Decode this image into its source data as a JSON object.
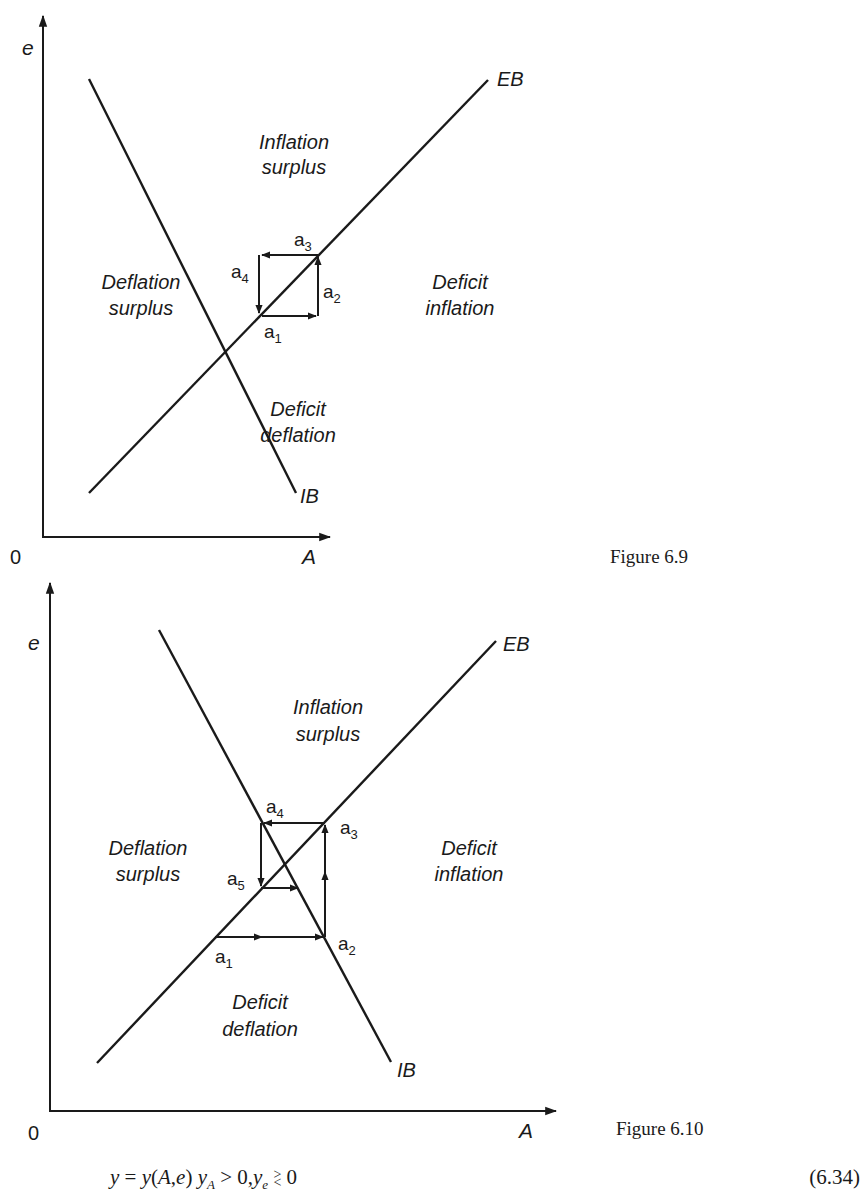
{
  "figure_1": {
    "caption": "Figure 6.9",
    "axis_y_label": "e",
    "axis_x_label": "A",
    "origin_label": "0",
    "curves": {
      "eb": "EB",
      "ib": "IB"
    },
    "regions": {
      "top_line1": "Inflation",
      "top_line2": "surplus",
      "left_line1": "Deflation",
      "left_line2": "surplus",
      "right_line1": "Deficit",
      "right_line2": "inflation",
      "bottom_line1": "Deficit",
      "bottom_line2": "deflation"
    },
    "points": {
      "a1": "a",
      "a1_sub": "1",
      "a2": "a",
      "a2_sub": "2",
      "a3": "a",
      "a3_sub": "3",
      "a4": "a",
      "a4_sub": "4"
    }
  },
  "figure_2": {
    "caption": "Figure 6.10",
    "axis_y_label": "e",
    "axis_x_label": "A",
    "origin_label": "0",
    "curves": {
      "eb": "EB",
      "ib": "IB"
    },
    "regions": {
      "top_line1": "Inflation",
      "top_line2": "surplus",
      "left_line1": "Deflation",
      "left_line2": "surplus",
      "right_line1": "Deficit",
      "right_line2": "inflation",
      "bottom_line1": "Deficit",
      "bottom_line2": "deflation"
    },
    "points": {
      "a1": "a",
      "a1_sub": "1",
      "a2": "a",
      "a2_sub": "2",
      "a3": "a",
      "a3_sub": "3",
      "a4": "a",
      "a4_sub": "4",
      "a5": "a",
      "a5_sub": "5"
    }
  },
  "equation": {
    "lhs": "y",
    "eq": " = ",
    "fn": "y",
    "args_open": "(",
    "arg1": "A",
    "comma": ",",
    "arg2": "e",
    "args_close": ")",
    "cond1_var": "y",
    "cond1_sub": "A",
    "cond1_rel": " > 0,",
    "cond2_var": "y",
    "cond2_sub": "e",
    "cond2_rel_top": ">",
    "cond2_rel_bottom": "<",
    "cond2_rhs": " 0",
    "number": "(6.34)"
  }
}
